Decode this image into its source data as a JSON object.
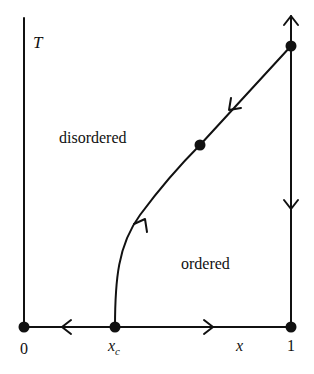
{
  "diagram": {
    "type": "phase-diagram-rg-flow",
    "axes": {
      "y_label": "T",
      "x_label": "x",
      "x_ticks": [
        "0",
        "x_c",
        "1"
      ]
    },
    "regions": {
      "upper_left": "disordered",
      "lower_right": "ordered"
    },
    "labels": {
      "T": "T",
      "x": "x",
      "zero": "0",
      "one": "1",
      "xc_main": "x",
      "xc_sub": "c"
    },
    "fixed_points": [
      {
        "name": "origin",
        "x": "0",
        "T": "0"
      },
      {
        "name": "critical",
        "x": "x_c",
        "T": "0"
      },
      {
        "name": "pure-zero-T",
        "x": "1",
        "T": "0"
      },
      {
        "name": "pure-critical",
        "x": "1",
        "T": "T_c"
      },
      {
        "name": "multicritical",
        "on": "phase-boundary"
      }
    ],
    "flows": [
      {
        "along": "x-axis",
        "from": "x_c",
        "to": "0",
        "direction": "left"
      },
      {
        "along": "x-axis",
        "from": "x_c",
        "to": "1",
        "direction": "right"
      },
      {
        "along": "x=1",
        "from": "pure-critical",
        "direction": "up"
      },
      {
        "along": "x=1",
        "from": "pure-critical",
        "direction": "down"
      },
      {
        "along": "phase-boundary",
        "from": "x_c",
        "to": "multicritical",
        "direction": "up"
      },
      {
        "along": "phase-boundary",
        "from": "pure-critical",
        "to": "multicritical",
        "direction": "down"
      }
    ],
    "colors": {
      "line": "#111111",
      "background": "#ffffff"
    }
  }
}
